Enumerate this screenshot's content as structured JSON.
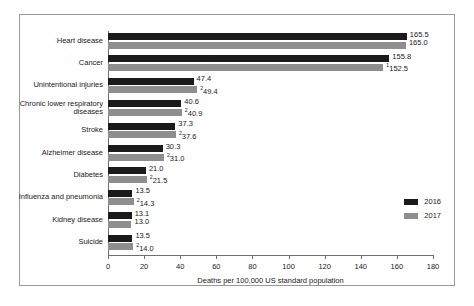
{
  "chart_data": {
    "type": "bar",
    "orientation": "horizontal",
    "title": "",
    "xlabel": "Deaths per 100,000 US standard population",
    "ylabel": "",
    "xlim": [
      0,
      180
    ],
    "xticks": [
      "0",
      "20",
      "40",
      "60",
      "80",
      "100",
      "120",
      "140",
      "160",
      "180"
    ],
    "grid": false,
    "legend_position": "right",
    "categories": [
      "Heart disease",
      "Cancer",
      "Unintentional injuries",
      "Chronic lower respiratory\ndiseases",
      "Stroke",
      "Alzheimer disease",
      "Diabetes",
      "Influenza and pneumonia",
      "Kidney disease",
      "Suicide"
    ],
    "series": [
      {
        "name": "2016",
        "color": "#1b1b1b",
        "values": [
          165.5,
          155.8,
          47.4,
          40.6,
          37.3,
          30.3,
          21.0,
          13.5,
          13.1,
          13.5
        ],
        "labels": [
          "165.5",
          "155.8",
          "47.4",
          "40.6",
          "37.3",
          "30.3",
          "21.0",
          "13.5",
          "13.1",
          "13.5"
        ],
        "markers": [
          "",
          "",
          "",
          "",
          "",
          "",
          "",
          "",
          "",
          ""
        ]
      },
      {
        "name": "2017",
        "color": "#8e8e8e",
        "values": [
          165.0,
          152.5,
          49.4,
          40.9,
          37.6,
          31.0,
          21.5,
          14.3,
          13.0,
          14.0
        ],
        "labels": [
          "165.0",
          "152.5",
          "49.4",
          "40.9",
          "37.6",
          "31.0",
          "21.5",
          "14.3",
          "13.0",
          "14.0"
        ],
        "markers": [
          "",
          "1",
          "2",
          "2",
          "2",
          "2",
          "2",
          "2",
          "",
          "2"
        ]
      }
    ]
  },
  "legend": {
    "items": [
      {
        "label": "2016",
        "color": "#1b1b1b"
      },
      {
        "label": "2017",
        "color": "#8e8e8e"
      }
    ]
  }
}
